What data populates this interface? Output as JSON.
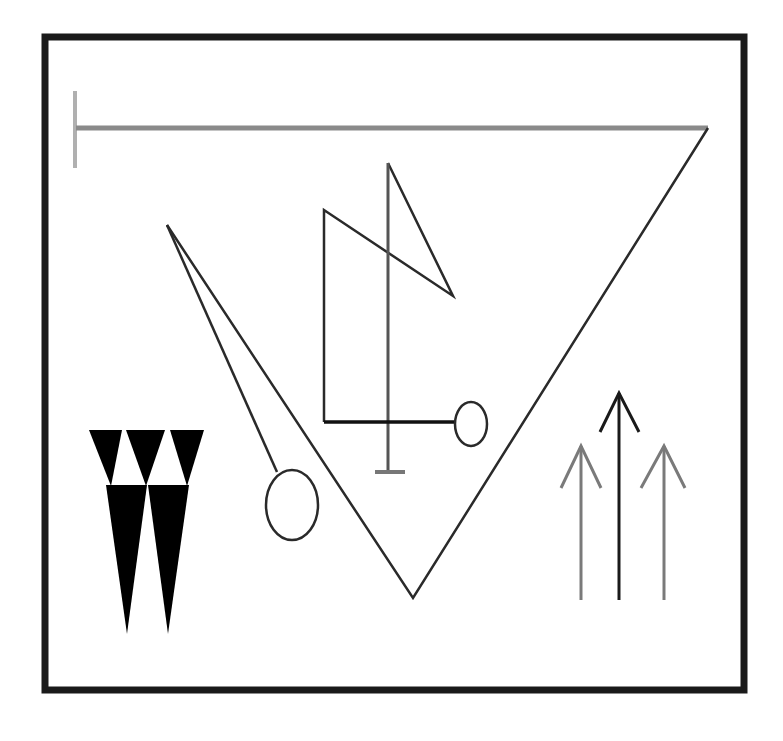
{
  "diagram": {
    "colors": {
      "background": "#ffffff",
      "frame": "#1a1a1a",
      "top_line": "#8a8a8a",
      "top_tick": "#b0b0b0",
      "lines": "#2a2a2a",
      "fill": "#000000",
      "arrow_side": "#7a7a7a",
      "arrow_center": "#1a1a1a"
    },
    "elements": [
      {
        "id": "frame",
        "label": "outer frame"
      },
      {
        "id": "top-line",
        "label": "horizontal bar with left tick"
      },
      {
        "id": "big-v",
        "label": "large V triangle"
      },
      {
        "id": "needle",
        "label": "narrow spike with ring"
      },
      {
        "id": "z-glyph",
        "label": "zig-zag glyph with ring and stand"
      },
      {
        "id": "w-shape",
        "label": "black W of triangles"
      },
      {
        "id": "arrows",
        "label": "three upward arrows"
      }
    ]
  }
}
